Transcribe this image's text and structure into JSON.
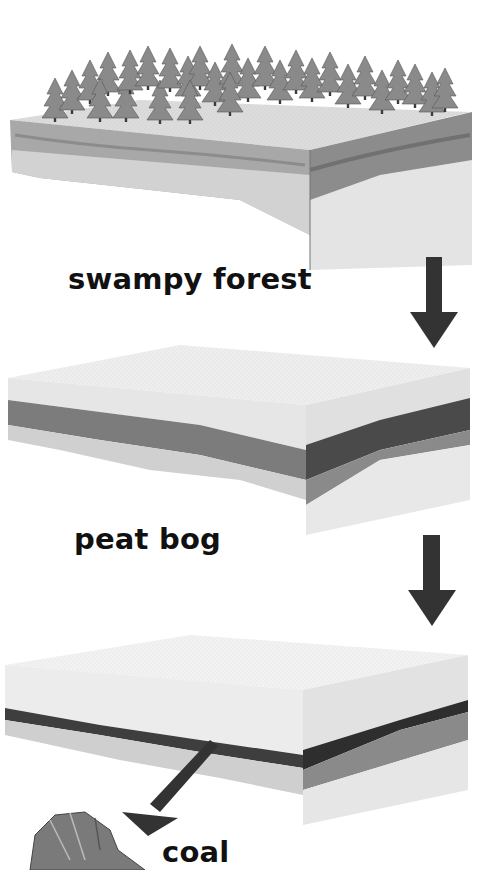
{
  "diagram": {
    "stages": [
      {
        "id": "swampy-forest",
        "label": "swampy forest"
      },
      {
        "id": "peat-bog",
        "label": "peat bog"
      },
      {
        "id": "coal",
        "label": "coal"
      }
    ],
    "arrows": [
      {
        "from": "swampy-forest",
        "to": "peat-bog",
        "direction": "down"
      },
      {
        "from": "peat-bog",
        "to": "coal",
        "direction": "down"
      },
      {
        "from": "coal-seam",
        "to": "coal-lump",
        "direction": "down-left"
      }
    ],
    "colors": {
      "background": "#ffffff",
      "arrow": "#333333",
      "soil_top": "#e8e8e8",
      "peat_layer": "#7a7a7a",
      "coal_layer": "#3a3a3a",
      "bedrock": "#d6d6d6",
      "side_dark": "#9a9a9a"
    }
  }
}
